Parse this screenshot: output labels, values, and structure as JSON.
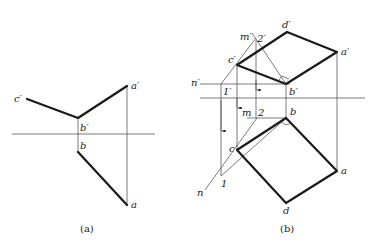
{
  "figure_a": {
    "caption": "(a)",
    "labels": {
      "c_prime": "c′",
      "b_prime": "b′",
      "a_prime": "a′",
      "b": "b",
      "a": "a"
    },
    "points": {
      "c_prime": [
        27,
        99
      ],
      "b_prime": [
        78,
        118
      ],
      "a_prime": [
        127,
        86
      ],
      "b": [
        78,
        152
      ],
      "a": [
        127,
        205
      ]
    },
    "axis": {
      "x1": 12,
      "x2": 155,
      "y": 134
    }
  },
  "figure_b": {
    "caption": "(b)",
    "labels": {
      "m_prime": "m′",
      "two_prime": "2′",
      "d_prime": "d′",
      "a_prime": "a′",
      "c_prime": "c′",
      "n_prime": "n′",
      "one_prime": "1′",
      "b_prime": "b′",
      "m": "m",
      "two": "2",
      "b": "b",
      "c": "c",
      "n": "n",
      "one": "1",
      "a": "a",
      "d": "d"
    },
    "points": {
      "apex": [
        256,
        38
      ],
      "d_prime": [
        287,
        32
      ],
      "a_prime": [
        337,
        52
      ],
      "c_prime": [
        237,
        65
      ],
      "b_prime": [
        286,
        84
      ],
      "one_prime": [
        221,
        84
      ],
      "b": [
        286,
        118
      ],
      "two": [
        257,
        118
      ],
      "c": [
        237,
        150
      ],
      "one": [
        221,
        176
      ],
      "n_end": [
        205,
        190
      ],
      "a": [
        337,
        171
      ],
      "d": [
        286,
        203
      ]
    },
    "axis": {
      "x1": 200,
      "x2": 365,
      "y": 98
    },
    "n_prime_line": {
      "x1": 200,
      "x2": 290,
      "y": 84
    }
  }
}
